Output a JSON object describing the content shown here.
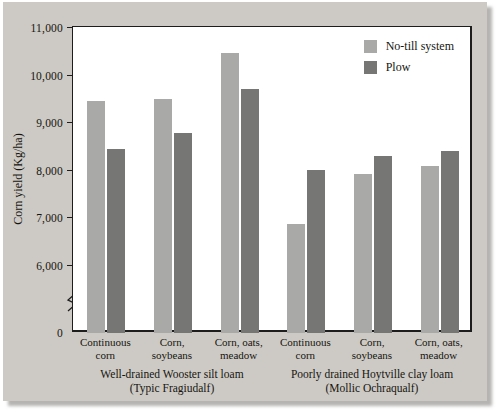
{
  "chart_data": {
    "type": "bar",
    "title": "",
    "xlabel": "",
    "ylabel": "Corn yield (Kg/ha)",
    "ylim": [
      6000,
      11000
    ],
    "y_baseline_label": "0",
    "axis_break": true,
    "grid": false,
    "legend_position": "top-right",
    "yticks": [
      {
        "value": 11000,
        "label": "11,000"
      },
      {
        "value": 10000,
        "label": "10,000"
      },
      {
        "value": 9000,
        "label": "9,000"
      },
      {
        "value": 8000,
        "label": "8,000"
      },
      {
        "value": 7000,
        "label": "7,000"
      },
      {
        "value": 6000,
        "label": "6,000"
      },
      {
        "value": 0,
        "label": "0"
      }
    ],
    "categories": [
      "Continuous\ncorn",
      "Corn,\nsoybeans",
      "Corn, oats,\nmeadow",
      "Continuous\ncorn",
      "Corn,\nsoybeans",
      "Corn, oats,\nmeadow"
    ],
    "series": [
      {
        "name": "No-till system",
        "color": "#a9a9a7",
        "values": [
          9440,
          9480,
          10450,
          6850,
          7900,
          8080
        ]
      },
      {
        "name": "Plow",
        "color": "#767674",
        "values": [
          8440,
          8770,
          9700,
          8000,
          8280,
          8400
        ]
      }
    ],
    "groups": [
      {
        "label": "Well-drained Wooster silt loam\n(Typic Fragiudalf)",
        "categories": [
          0,
          1,
          2
        ]
      },
      {
        "label": "Poorly drained Hoytville clay loam\n(Mollic Ochraqualf)",
        "categories": [
          3,
          4,
          5
        ]
      }
    ]
  },
  "legend": {
    "items": [
      {
        "label": "No-till system",
        "color": "#a9a9a7"
      },
      {
        "label": "Plow",
        "color": "#767674"
      }
    ]
  },
  "axis": {
    "y_title": "Corn yield (Kg/ha)"
  },
  "colors": {
    "background": "#cdcac5",
    "plot_background": "#ffffff",
    "axis": "#1d1d1d",
    "series_light": "#a9a9a7",
    "series_dark": "#767674"
  }
}
